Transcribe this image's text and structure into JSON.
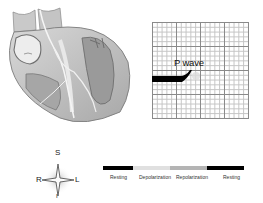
{
  "heart_illustration": {
    "description": "cross-section of heart with conduction pathways"
  },
  "ecg": {
    "label": "P wave",
    "grid": {
      "major_divisions": 4,
      "minor_per_major": 5
    },
    "trace_color": "#000000"
  },
  "compass": {
    "superior": "S",
    "inferior": "I",
    "right": "R",
    "left": "L"
  },
  "phase_bar": {
    "segments": [
      {
        "label": "Resting",
        "color": "#000000",
        "width": 30
      },
      {
        "label": "Depolarization",
        "color": "#e0e0e0",
        "width": 37
      },
      {
        "label": "Repolarization",
        "color": "#b4b4b4",
        "width": 36
      },
      {
        "label": "Resting",
        "color": "#000000",
        "width": 37
      }
    ]
  }
}
